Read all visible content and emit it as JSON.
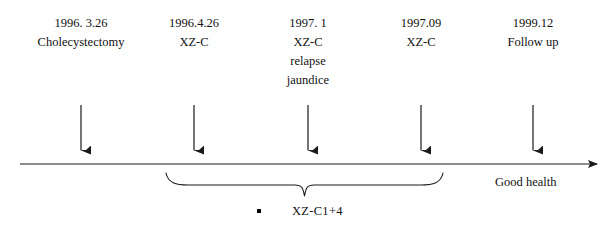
{
  "diagram": {
    "type": "timeline",
    "width": 605,
    "height": 230,
    "background_color": "#ffffff",
    "line_color": "#1a1a1a",
    "text_color": "#111111"
  },
  "events": [
    {
      "id": "event-1",
      "date": "1996. 3.26",
      "lines": [
        "1996. 3.26",
        "Cholecystectomy"
      ],
      "x": 81,
      "label_left": 10,
      "label_top": 14,
      "label_width": 142,
      "arrow_top": 105,
      "arrow_bottom": 152
    },
    {
      "id": "event-2",
      "date": "1996.4.26",
      "lines": [
        "1996.4.26",
        "XZ-C"
      ],
      "x": 194,
      "label_left": 139,
      "label_top": 14,
      "label_width": 110,
      "arrow_top": 105,
      "arrow_bottom": 152
    },
    {
      "id": "event-3",
      "date": "1997. 1",
      "lines": [
        "1997. 1",
        "XZ-C",
        "relapse",
        "jaundice"
      ],
      "x": 308,
      "label_left": 253,
      "label_top": 14,
      "label_width": 110,
      "arrow_top": 105,
      "arrow_bottom": 152
    },
    {
      "id": "event-4",
      "date": "1997.09",
      "lines": [
        "1997.09",
        "XZ-C"
      ],
      "x": 421,
      "label_left": 366,
      "label_top": 14,
      "label_width": 110,
      "arrow_top": 105,
      "arrow_bottom": 152
    },
    {
      "id": "event-5",
      "date": "1999.12",
      "lines": [
        "1999.12",
        "Follow up"
      ],
      "x": 533,
      "label_left": 478,
      "label_top": 14,
      "label_width": 110,
      "arrow_top": 105,
      "arrow_bottom": 152
    }
  ],
  "axis": {
    "y": 164,
    "x_start": 20,
    "x_end": 600,
    "end_label": "Good health",
    "end_label_left": 495,
    "end_label_top": 174
  },
  "brace": {
    "label": "XZ-C1+4",
    "label_left": 292,
    "label_top": 203,
    "x_left": 166,
    "x_right": 443,
    "y_top": 173,
    "y_tip": 196,
    "bullet": {
      "left": 257,
      "top": 209
    }
  }
}
